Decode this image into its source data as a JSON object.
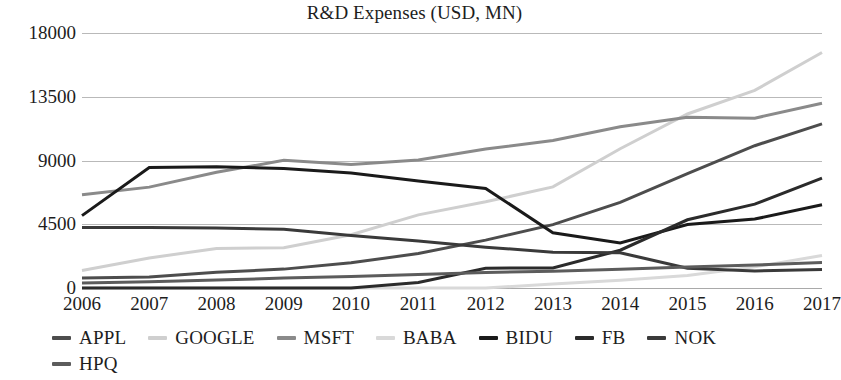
{
  "chart_data": {
    "type": "line",
    "title": "R&D Expenses (USD, MN)",
    "xlabel": "",
    "ylabel": "",
    "x": [
      2006,
      2007,
      2008,
      2009,
      2010,
      2011,
      2012,
      2013,
      2014,
      2015,
      2016,
      2017
    ],
    "categories": [
      "2006",
      "2007",
      "2008",
      "2009",
      "2010",
      "2011",
      "2012",
      "2013",
      "2014",
      "2015",
      "2016",
      "2017"
    ],
    "ylim": [
      0,
      18000
    ],
    "yticks": [
      0,
      4500,
      9000,
      13500,
      18000
    ],
    "ytick_labels": [
      "0",
      "4500",
      "9000",
      "13500",
      "18000"
    ],
    "grid": true,
    "legend_position": "bottom",
    "series": [
      {
        "name": "APPL",
        "color": "#4d4d4d",
        "width": 3,
        "values": [
          712,
          782,
          1109,
          1333,
          1782,
          2429,
          3381,
          4475,
          6041,
          8067,
          10045,
          11581
        ]
      },
      {
        "name": "GOOGLE",
        "color": "#cfcfcf",
        "width": 3,
        "values": [
          1229,
          2120,
          2793,
          2843,
          3762,
          5162,
          6083,
          7137,
          9832,
          12282,
          13948,
          16625
        ]
      },
      {
        "name": "MSFT",
        "color": "#8a8a8a",
        "width": 3,
        "values": [
          6584,
          7121,
          8164,
          9010,
          8714,
          9043,
          9811,
          10411,
          11381,
          12046,
          11988,
          13037
        ]
      },
      {
        "name": "BABA",
        "color": "#d9d9d9",
        "width": 3,
        "values": [
          0,
          0,
          0,
          0,
          0,
          0,
          0,
          276,
          543,
          889,
          1490,
          2296
        ]
      },
      {
        "name": "BIDU",
        "color": "#1a1a1a",
        "width": 3,
        "values": [
          5110,
          8512,
          8558,
          8427,
          8110,
          7555,
          7031,
          3900,
          3180,
          4480,
          4865,
          5879
        ]
      },
      {
        "name": "FB",
        "color": "#2b2b2b",
        "width": 3,
        "values": [
          0,
          0,
          0,
          0,
          0,
          388,
          1399,
          1415,
          2666,
          4816,
          5919,
          7754
        ]
      },
      {
        "name": "NOK",
        "color": "#3a3a3a",
        "width": 3,
        "values": [
          4271,
          4276,
          4236,
          4144,
          3705,
          3310,
          2880,
          2530,
          2492,
          1400,
          1200,
          1300
        ]
      },
      {
        "name": "HPQ",
        "color": "#5c5c5c",
        "width": 3,
        "values": [
          350,
          450,
          560,
          700,
          820,
          950,
          1090,
          1190,
          1330,
          1480,
          1620,
          1795
        ]
      }
    ]
  },
  "legend": {
    "row1": [
      "APPL",
      "GOOGLE",
      "MSFT",
      "BABA",
      "BIDU",
      "FB",
      "NOK"
    ],
    "row2": [
      "HPQ"
    ]
  }
}
